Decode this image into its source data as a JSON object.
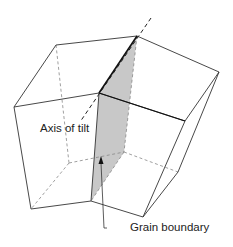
{
  "diagram": {
    "type": "3d-grain-tilt-boundary",
    "labels": {
      "axis_of_tilt": "Axis of tilt",
      "grain_boundary": "Grain boundary"
    },
    "colors": {
      "line": "#333333",
      "hidden_line": "#888888",
      "boundary_fill": "#c8c8c8",
      "background": "#ffffff"
    }
  }
}
